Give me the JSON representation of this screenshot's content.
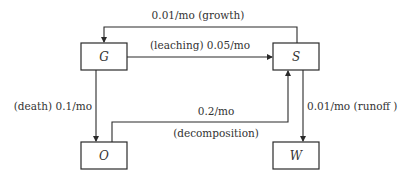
{
  "nodes": {
    "G": {
      "label": "G"
    },
    "S": {
      "label": "S"
    },
    "O": {
      "label": "O"
    },
    "W": {
      "label": "W"
    }
  },
  "edges": {
    "growth": {
      "from": "S",
      "to": "G",
      "label": "0.01/mo (growth)"
    },
    "leaching": {
      "from": "G",
      "to": "S",
      "label": "(leaching) 0.05/mo"
    },
    "death": {
      "from": "G",
      "to": "O",
      "label": "(death) 0.1/mo"
    },
    "decomposition": {
      "from": "O",
      "to": "S",
      "rate_label": "0.2/mo",
      "name_label": "(decomposition)"
    },
    "runoff": {
      "from": "S",
      "to": "W",
      "label": "0.01/mo (runoff )"
    }
  },
  "colors": {
    "stroke": "#2a2a2a",
    "text": "#333333",
    "background": "#ffffff"
  }
}
